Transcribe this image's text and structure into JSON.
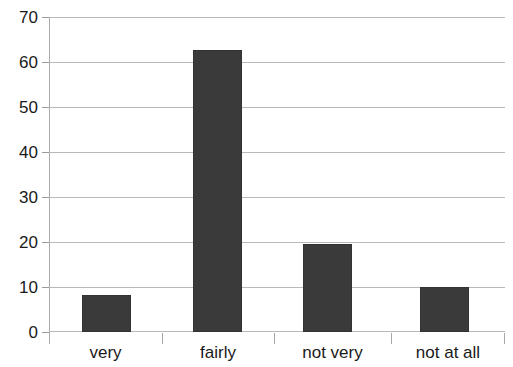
{
  "chart_data": {
    "type": "bar",
    "title": "",
    "subtitle": "",
    "xlabel": "",
    "ylabel": "",
    "categories": [
      "very",
      "fairly",
      "not very",
      "not at all"
    ],
    "values": [
      8.3,
      62.6,
      19.5,
      10.1
    ],
    "series": [
      {
        "name": "",
        "values": [
          8.3,
          62.6,
          19.5,
          10.1
        ]
      }
    ],
    "ylim": [
      0,
      70
    ],
    "ytick_step": 10,
    "ytick_labels": [
      "0",
      "10",
      "20",
      "30",
      "40",
      "50",
      "60",
      "70"
    ],
    "ytick_values": [
      0,
      10,
      20,
      30,
      40,
      50,
      60,
      70
    ],
    "grid": true,
    "grid_axis": "y",
    "legend": false,
    "legend_position": "none",
    "annotations": [],
    "colors": {
      "bar_fill": "#3a3a3a",
      "bar_border": "#333333",
      "gridline": "#b9b9b9",
      "axis": "#a8a8a8",
      "text": "#1a1a1a",
      "background": "#ffffff"
    }
  },
  "axes": {
    "y": {
      "ticks": [
        {
          "label": "70",
          "value": 70
        },
        {
          "label": "60",
          "value": 60
        },
        {
          "label": "50",
          "value": 50
        },
        {
          "label": "40",
          "value": 40
        },
        {
          "label": "30",
          "value": 30
        },
        {
          "label": "20",
          "value": 20
        },
        {
          "label": "10",
          "value": 10
        },
        {
          "label": "0",
          "value": 0
        }
      ]
    },
    "x": {
      "ticks": [
        {
          "label": "very"
        },
        {
          "label": "fairly"
        },
        {
          "label": "not very"
        },
        {
          "label": "not at all"
        }
      ]
    }
  }
}
